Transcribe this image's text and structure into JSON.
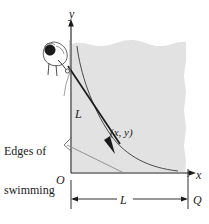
{
  "figure": {
    "kind": "math-textbook-diagram",
    "topic": "tractrix / swimming pool pursuit curve",
    "background_color": "#ffffff",
    "pool_fill_color": "#e2e2e2",
    "ink_color": "#1a1a1a",
    "faint_ink_color": "#6e6e6e"
  },
  "axes": {
    "y_label": "y",
    "x_label": "x",
    "origin_label": "O"
  },
  "labels": {
    "rope_length": "L",
    "dimension_length": "L",
    "point_coordinates": "(x, y)",
    "corner_point": "Q"
  },
  "annotation": {
    "line1": "Edges of",
    "line2": "swimming",
    "line3": "pool"
  },
  "icons": {
    "person": "person-icon",
    "arrowhead_y": "arrowhead-up-icon",
    "arrowhead_x": "arrowhead-right-icon",
    "arrowhead_rope": "arrowhead-down-left-icon",
    "leader_bracket": "leader-bracket-icon"
  }
}
